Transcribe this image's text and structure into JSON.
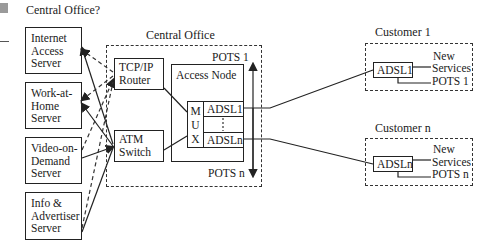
{
  "page": {
    "title": "Central Office?",
    "marker_color": "#9a9a9a"
  },
  "servers": [
    {
      "id": "internet-access",
      "lines": [
        "Internet",
        "Access",
        "Server"
      ]
    },
    {
      "id": "work-at-home",
      "lines": [
        "Work-at-",
        "Home",
        "Server"
      ]
    },
    {
      "id": "video-on-demand",
      "lines": [
        "Video-on-",
        "Demand",
        "Server"
      ]
    },
    {
      "id": "info-advertiser",
      "lines": [
        "Info &",
        "Advertiser",
        "Server"
      ]
    }
  ],
  "central_office": {
    "label": "Central Office",
    "router": {
      "lines": [
        "TCP/IP",
        "Router"
      ]
    },
    "atm_switch": {
      "lines": [
        "ATM",
        "Switch"
      ]
    },
    "access_node": {
      "label": "Access Node",
      "mux_letters": [
        "M",
        "U",
        "X"
      ],
      "adsl_first": "ADSL1",
      "adsl_last": "ADSLn"
    },
    "pots_top": "POTS 1",
    "pots_bottom": "POTS n"
  },
  "customers": [
    {
      "label": "Customer 1",
      "modem": "ADSL1",
      "outputs": [
        "New",
        "Services",
        "POTS 1"
      ]
    },
    {
      "label": "Customer n",
      "modem": "ADSLn",
      "outputs": [
        "New",
        "Services",
        "POTS n"
      ]
    }
  ],
  "colors": {
    "line": "#222222",
    "dashed": "#333333",
    "background": "#ffffff"
  }
}
